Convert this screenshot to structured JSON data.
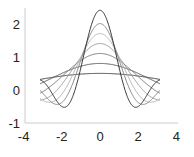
{
  "chart_data": {
    "type": "line",
    "title": "",
    "xlabel": "",
    "ylabel": "",
    "xlim": [
      -4,
      4
    ],
    "ylim": [
      -1,
      2.5
    ],
    "grid": false,
    "legend": null,
    "xticks": [
      "-4",
      "-2",
      "0",
      "2",
      "4"
    ],
    "yticks": [
      "-1",
      "0",
      "1",
      "2"
    ],
    "function": "y = sin(k*x)/x",
    "x_range": [
      -3.1416,
      3.1416
    ],
    "series": [
      {
        "name": "k=0.5",
        "k": 0.5,
        "color": "#3a3a3a"
      },
      {
        "name": "k=0.8",
        "k": 0.8,
        "color": "#555555"
      },
      {
        "name": "k=1.1",
        "k": 1.1,
        "color": "#777777"
      },
      {
        "name": "k=1.4",
        "k": 1.4,
        "color": "#999999"
      },
      {
        "name": "k=1.7",
        "k": 1.7,
        "color": "#b5b5b5"
      },
      {
        "name": "k=2.0",
        "k": 2.0,
        "color": "#888888"
      },
      {
        "name": "k=2.4",
        "k": 2.4,
        "color": "#333333"
      }
    ]
  },
  "axis_color": "#cccccc"
}
